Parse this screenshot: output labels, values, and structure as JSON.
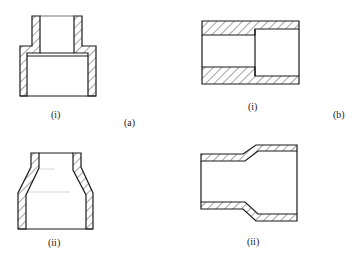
{
  "figure": {
    "groups": [
      {
        "id": "a",
        "label": "(a)",
        "parts": [
          {
            "id": "a-i",
            "label": "(i)",
            "type": "stepped-socket-reducer-vertical"
          },
          {
            "id": "a-ii",
            "label": "(ii)",
            "type": "tapered-reducer-vertical"
          }
        ]
      },
      {
        "id": "b",
        "label": "(b)",
        "parts": [
          {
            "id": "b-i",
            "label": "(i)",
            "type": "stepped-bore-reducer-horizontal"
          },
          {
            "id": "b-ii",
            "label": "(ii)",
            "type": "swaged-reducer-horizontal"
          }
        ]
      }
    ]
  },
  "labels": {
    "a_i": "(i)",
    "a_group": "(a)",
    "b_i": "(i)",
    "b_group": "(b)",
    "a_ii": "(ii)",
    "b_ii": "(ii)"
  },
  "colors": {
    "stroke": "#1a1a1a",
    "background": "#ffffff"
  }
}
